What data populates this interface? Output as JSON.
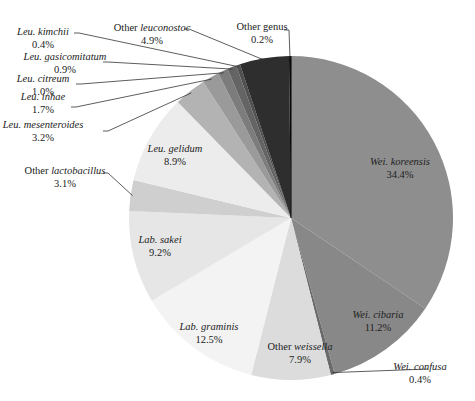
{
  "chart_data": {
    "type": "pie",
    "title": "",
    "start_angle_deg": 0,
    "direction": "clockwise",
    "unit": "%",
    "slices": [
      {
        "genus_prefix": "Wei.",
        "name": "Wei. koreensis",
        "label_plain": "",
        "label_italic": "Wei. koreensis",
        "value": 34.4,
        "value_label": "34.4%",
        "color": "#8e8e8e",
        "label_inside": true
      },
      {
        "genus_prefix": "Wei.",
        "name": "Wei. cibaria",
        "label_plain": "",
        "label_italic": "Wei. cibaria",
        "value": 11.2,
        "value_label": "11.2%",
        "color": "#888888",
        "label_inside": true
      },
      {
        "genus_prefix": "Wei.",
        "name": "Wei. confusa",
        "label_plain": "",
        "label_italic": "Wei. confusa",
        "value": 0.4,
        "value_label": "0.4%",
        "color": "#6a6a6a",
        "label_inside": false
      },
      {
        "genus_prefix": "",
        "name": "Other weissella",
        "label_plain": "Other ",
        "label_italic": "weissella",
        "value": 7.9,
        "value_label": "7.9%",
        "color": "#dcdcdc",
        "label_inside": true
      },
      {
        "genus_prefix": "Lab.",
        "name": "Lab. graminis",
        "label_plain": "",
        "label_italic": "Lab. graminis",
        "value": 12.5,
        "value_label": "12.5%",
        "color": "#f3f3f3",
        "label_inside": true
      },
      {
        "genus_prefix": "Lab.",
        "name": "Lab. sakei",
        "label_plain": "",
        "label_italic": "Lab. sakei",
        "value": 9.2,
        "value_label": "9.2%",
        "color": "#e6e6e6",
        "label_inside": true
      },
      {
        "genus_prefix": "",
        "name": "Other lactobacillus",
        "label_plain": "Other ",
        "label_italic": "lactobacillus",
        "value": 3.1,
        "value_label": "3.1%",
        "color": "#cfcfcf",
        "label_inside": false
      },
      {
        "genus_prefix": "Leu.",
        "name": "Leu. gelidum",
        "label_plain": "",
        "label_italic": "Leu. gelidum",
        "value": 8.9,
        "value_label": "8.9%",
        "color": "#ececec",
        "label_inside": true
      },
      {
        "genus_prefix": "Leu.",
        "name": "Leu. mesenteroides",
        "label_plain": "",
        "label_italic": "Leu. mesenteroides",
        "value": 3.2,
        "value_label": "3.2%",
        "color": "#b3b3b3",
        "label_inside": false
      },
      {
        "genus_prefix": "Leu.",
        "name": "Leu. inhae",
        "label_plain": "",
        "label_italic": "Leu. inhae",
        "value": 1.7,
        "value_label": "1.7%",
        "color": "#9a9a9a",
        "label_inside": false
      },
      {
        "genus_prefix": "Leu.",
        "name": "Leu. citreum",
        "label_plain": "",
        "label_italic": "Leu. citreum",
        "value": 1.0,
        "value_label": "1.0%",
        "color": "#7c7c7c",
        "label_inside": false
      },
      {
        "genus_prefix": "Leu.",
        "name": "Leu. gasicomitatum",
        "label_plain": "",
        "label_italic": "Leu. gasicomitatum",
        "value": 0.9,
        "value_label": "0.9%",
        "color": "#646464",
        "label_inside": false
      },
      {
        "genus_prefix": "Leu.",
        "name": "Leu. kimchii",
        "label_plain": "",
        "label_italic": "Leu. kimchii",
        "value": 0.4,
        "value_label": "0.4%",
        "color": "#505050",
        "label_inside": false
      },
      {
        "genus_prefix": "",
        "name": "Other leuconostoc",
        "label_plain": "Other ",
        "label_italic": "leuconostoc",
        "value": 4.9,
        "value_label": "4.9%",
        "color": "#2e2e2e",
        "label_inside": false
      },
      {
        "genus_prefix": "",
        "name": "Other genus",
        "label_plain": "Other genus",
        "label_italic": "",
        "value": 0.2,
        "value_label": "0.2%",
        "color": "#111111",
        "label_inside": false
      }
    ],
    "legend": "none (direct labels with leader lines)"
  }
}
